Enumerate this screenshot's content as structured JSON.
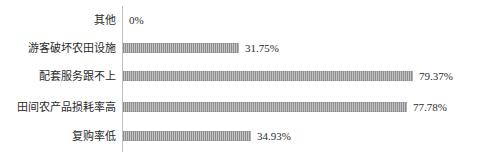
{
  "chart_data": {
    "type": "bar",
    "orientation": "horizontal",
    "title": "",
    "subtitle": "",
    "xlabel": "",
    "ylabel": "",
    "grid": false,
    "legend": false,
    "xlim": [
      0,
      100
    ],
    "units": "%",
    "categories": [
      "其他",
      "游客破坏农田设施",
      "配套服务跟不上",
      "田间农产品损耗率高",
      "复购率低"
    ],
    "values": [
      0,
      31.75,
      79.37,
      77.78,
      34.93
    ],
    "value_labels": [
      "0%",
      "31.75%",
      "79.37%",
      "77.78%",
      "34.93%"
    ],
    "bar_fill": "#9b9b9b",
    "bar_pattern": "vertical-stripes",
    "axis_color": "#bfbfbf",
    "text_color": "#2b2b2b"
  },
  "rows": [
    {
      "label": "其他",
      "value": 0,
      "value_label": "0%",
      "bar_px": 0,
      "top": 6
    },
    {
      "label": "游客破坏农田设施",
      "value": 31.75,
      "value_label": "31.75%",
      "bar_px": 116,
      "top": 34
    },
    {
      "label": "配套服务跟不上",
      "value": 79.37,
      "value_label": "79.37%",
      "bar_px": 290,
      "top": 62
    },
    {
      "label": "田间农产品损耗率高",
      "value": 77.78,
      "value_label": "77.78%",
      "bar_px": 284,
      "top": 93
    },
    {
      "label": "复购率低",
      "value": 34.93,
      "value_label": "34.93%",
      "bar_px": 128,
      "top": 122
    }
  ]
}
